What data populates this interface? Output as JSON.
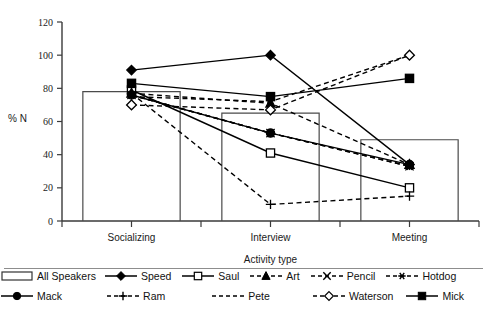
{
  "chart_data": {
    "type": "line",
    "title": "",
    "xlabel": "Activity type",
    "ylabel": "% N",
    "categories": [
      "Socializing",
      "Interview",
      "Meeting"
    ],
    "ylim": [
      0,
      120
    ],
    "yticks": [
      0,
      20,
      40,
      60,
      80,
      100,
      120
    ],
    "grid": false,
    "legend_position": "bottom",
    "bars": {
      "name": "All Speakers",
      "values": [
        78,
        65,
        49
      ],
      "style": "open-rectangle-outline"
    },
    "series": [
      {
        "name": "Speed",
        "values": [
          91,
          100,
          34
        ],
        "marker": "filled-diamond",
        "line": "solid"
      },
      {
        "name": "Saul",
        "values": [
          79,
          41,
          20
        ],
        "marker": "open-square",
        "line": "solid"
      },
      {
        "name": "Art",
        "values": [
          77,
          71,
          34
        ],
        "marker": "filled-triangle",
        "line": "dashed"
      },
      {
        "name": "Pencil",
        "values": [
          76,
          53,
          33
        ],
        "marker": "cross-x",
        "line": "dashed"
      },
      {
        "name": "Hotdog",
        "values": [
          76,
          53,
          33
        ],
        "marker": "asterisk",
        "line": "dashed"
      },
      {
        "name": "Mack",
        "values": [
          76,
          53,
          34
        ],
        "marker": "filled-circle",
        "line": "solid"
      },
      {
        "name": "Ram",
        "values": [
          77,
          10,
          15
        ],
        "marker": "plus",
        "line": "dashed"
      },
      {
        "name": "Pete",
        "values": [
          75,
          72,
          100
        ],
        "marker": "none",
        "line": "dashed"
      },
      {
        "name": "Waterson",
        "values": [
          70,
          67,
          100
        ],
        "marker": "open-diamond",
        "line": "dashed"
      },
      {
        "name": "Mick",
        "values": [
          83,
          75,
          86
        ],
        "marker": "filled-square",
        "line": "solid"
      }
    ]
  },
  "legend": {
    "row1": [
      {
        "label": "All Speakers",
        "symbol": "open-rectangle-outline"
      },
      {
        "label": "Speed",
        "symbol": "filled-diamond"
      },
      {
        "label": "Saul",
        "symbol": "open-square"
      },
      {
        "label": "Art",
        "symbol": "filled-triangle"
      },
      {
        "label": "Pencil",
        "symbol": "cross-x"
      },
      {
        "label": "Hotdog",
        "symbol": "asterisk"
      }
    ],
    "row2": [
      {
        "label": "Mack",
        "symbol": "filled-circle"
      },
      {
        "label": "Ram",
        "symbol": "plus"
      },
      {
        "label": "Pete",
        "symbol": "none"
      },
      {
        "label": "Waterson",
        "symbol": "open-diamond"
      },
      {
        "label": "Mick",
        "symbol": "filled-square"
      }
    ]
  },
  "axis": {
    "y_label": "% N",
    "x_label": "Activity type",
    "y_ticks": [
      "0",
      "20",
      "40",
      "60",
      "80",
      "100",
      "120"
    ],
    "x_ticks": [
      "Socializing",
      "Interview",
      "Meeting"
    ]
  }
}
